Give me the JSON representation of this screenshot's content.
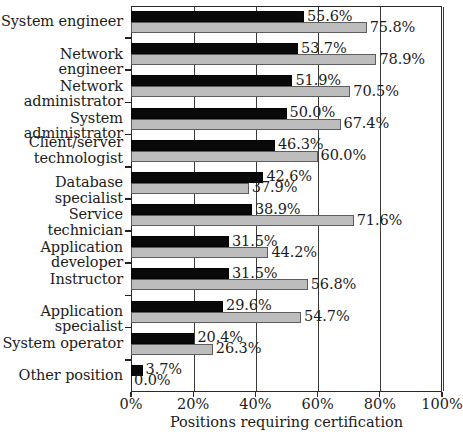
{
  "chart_data": {
    "type": "bar",
    "orientation": "horizontal",
    "title": "",
    "xlabel": "Positions requiring certification",
    "ylabel": "",
    "xlim": [
      0,
      100
    ],
    "xticks": [
      "0%",
      "20%",
      "40%",
      "60%",
      "80%",
      "100%"
    ],
    "xtick_values": [
      0,
      20,
      40,
      60,
      80,
      100
    ],
    "grid": true,
    "legend": "none",
    "value_label_suffix": "%",
    "categories": [
      "System engineer",
      "Network engineer",
      "Network administrator",
      "System administrator",
      "Client/server\ntechnologist",
      "Database specialist",
      "Service technician",
      "Application developer",
      "Instructor",
      "Application specialist",
      "System operator",
      "Other position"
    ],
    "series": [
      {
        "name": "series-black",
        "color": "#090909",
        "values": [
          55.6,
          53.7,
          51.9,
          50.0,
          46.3,
          42.6,
          38.9,
          31.5,
          31.5,
          29.6,
          20.4,
          3.7
        ],
        "labels": [
          "55.6%",
          "53.7%",
          "51.9%",
          "50.0%",
          "46.3%",
          "42.6%",
          "38.9%",
          "31.5%",
          "31.5%",
          "29.6%",
          "20.4%",
          "3.7%"
        ]
      },
      {
        "name": "series-gray",
        "color": "#bdbdbd",
        "values": [
          75.8,
          78.9,
          70.5,
          67.4,
          60.0,
          37.9,
          71.6,
          44.2,
          56.8,
          54.7,
          26.3,
          0.0
        ],
        "labels": [
          "75.8%",
          "78.9%",
          "70.5%",
          "67.4%",
          "60.0%",
          "37.9%",
          "71.6%",
          "44.2%",
          "56.8%",
          "54.7%",
          "26.3%",
          "0.0%"
        ]
      }
    ]
  }
}
